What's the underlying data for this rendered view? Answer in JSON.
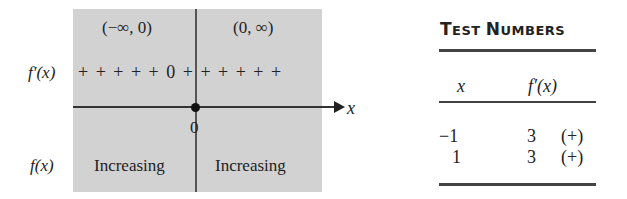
{
  "number_line": {
    "intervals": [
      "(−∞, 0)",
      "(0, ∞)"
    ],
    "derivative_label": "f′(x)",
    "sign_row": "+ + + + + 0 + + + + + +",
    "critical_point": "0",
    "axis_label": "x",
    "function_label": "f(x)",
    "behavior": [
      "Increasing",
      "Increasing"
    ]
  },
  "table": {
    "title_parts": [
      {
        "big": "T",
        "small": "EST "
      },
      {
        "big": "N",
        "small": "UMBERS"
      }
    ],
    "headers": [
      "x",
      "f′(x)"
    ],
    "rows": [
      {
        "x": "−1",
        "value": "3",
        "sign": "(+)"
      },
      {
        "x": "1",
        "value": "3",
        "sign": "(+)"
      }
    ]
  }
}
